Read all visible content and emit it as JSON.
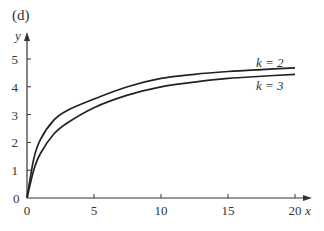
{
  "panel_label": "(d)",
  "chart_data": {
    "type": "line",
    "title": "(d)",
    "xlabel": "x",
    "ylabel": "y",
    "xlim": [
      0,
      20
    ],
    "ylim": [
      0,
      5
    ],
    "xticks": [
      0,
      5,
      10,
      15,
      20
    ],
    "yticks": [
      0,
      1,
      2,
      3,
      4,
      5
    ],
    "grid": false,
    "legend": "inline labels at right end of curves",
    "x": [
      0,
      0.5,
      1,
      2,
      3,
      5,
      7.5,
      10,
      12.5,
      15,
      17.5,
      20
    ],
    "series": [
      {
        "name": "k = 2",
        "values": [
          0,
          1.4,
          2.1,
          2.8,
          3.15,
          3.56,
          4.0,
          4.3,
          4.45,
          4.55,
          4.62,
          4.68
        ]
      },
      {
        "name": "k = 3",
        "values": [
          0,
          1.0,
          1.6,
          2.3,
          2.7,
          3.25,
          3.7,
          4.0,
          4.17,
          4.3,
          4.38,
          4.45
        ]
      }
    ]
  },
  "labels": {
    "axis_x": "x",
    "axis_y": "y",
    "series_1": "k = 2",
    "series_2": "k = 3",
    "origin_y": "0",
    "ytick_labels": [
      "1",
      "2",
      "3",
      "4",
      "5"
    ],
    "xtick_labels": [
      "0",
      "5",
      "10",
      "15",
      "20"
    ]
  }
}
